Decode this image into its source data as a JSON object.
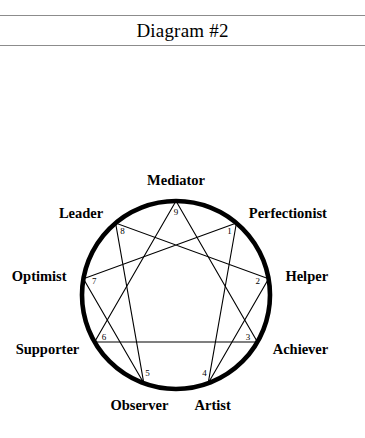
{
  "header": {
    "title": "Diagram #2",
    "rule_color": "#8c8c8c"
  },
  "diagram": {
    "name": "enneagram",
    "circle_color": "#000000",
    "line_color": "#000000",
    "center": {
      "x": 176,
      "y": 235
    },
    "radius": 94,
    "points": [
      {
        "num": "1",
        "label": "Perfectionist",
        "angle_deg": -50,
        "label_side": "right"
      },
      {
        "num": "2",
        "label": "Helper",
        "angle_deg": -10,
        "label_side": "right"
      },
      {
        "num": "3",
        "label": "Achiever",
        "angle_deg": 30,
        "label_side": "right"
      },
      {
        "num": "4",
        "label": "Artist",
        "angle_deg": 70,
        "label_side": "below"
      },
      {
        "num": "5",
        "label": "Observer",
        "angle_deg": 110,
        "label_side": "below"
      },
      {
        "num": "6",
        "label": "Supporter",
        "angle_deg": 150,
        "label_side": "left"
      },
      {
        "num": "7",
        "label": "Optimist",
        "angle_deg": 190,
        "label_side": "left"
      },
      {
        "num": "8",
        "label": "Leader",
        "angle_deg": 230,
        "label_side": "left"
      },
      {
        "num": "9",
        "label": "Mediator",
        "angle_deg": 270,
        "label_side": "above"
      }
    ],
    "triangle_path": [
      "9",
      "3",
      "6",
      "9"
    ],
    "hexad_path": [
      "1",
      "4",
      "2",
      "8",
      "5",
      "7",
      "1"
    ]
  }
}
